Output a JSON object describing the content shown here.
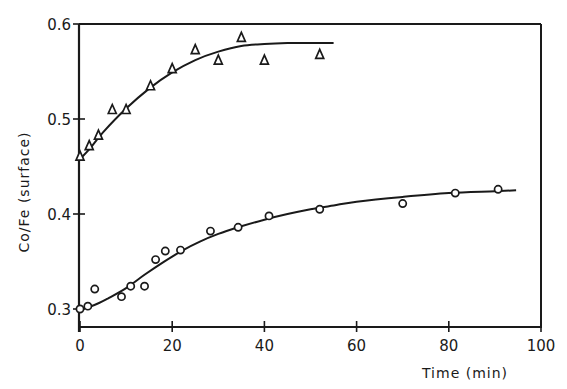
{
  "chart_data": {
    "type": "scatter",
    "title": "",
    "xlabel": "Time (min)",
    "ylabel": "Co/Fe (surface)",
    "xlim": [
      0,
      100
    ],
    "ylim": [
      0.281,
      0.6
    ],
    "x_ticks": [
      0,
      20,
      40,
      60,
      80,
      100
    ],
    "x_tick_labels": [
      "0",
      "20",
      "40",
      "60",
      "80",
      "100"
    ],
    "y_ticks": [
      0.3,
      0.4,
      0.5,
      0.6
    ],
    "y_tick_labels": [
      "0.3",
      "0.4",
      "0.5",
      "0.6"
    ],
    "grid": false,
    "legend": null,
    "series": [
      {
        "name": "triangles",
        "marker": "triangle",
        "x": [
          0,
          2,
          4,
          7,
          10,
          15.3,
          20,
          25,
          30,
          35,
          40,
          52
        ],
        "y": [
          0.461,
          0.472,
          0.483,
          0.51,
          0.51,
          0.535,
          0.553,
          0.573,
          0.562,
          0.586,
          0.562,
          0.568
        ],
        "fit_curve": {
          "x": [
            0,
            2,
            5,
            10,
            15,
            20,
            25,
            30,
            35,
            40,
            45,
            50,
            55
          ],
          "y": [
            0.458,
            0.468,
            0.486,
            0.511,
            0.532,
            0.549,
            0.562,
            0.571,
            0.577,
            0.579,
            0.58,
            0.58,
            0.58
          ],
          "dashed": false
        }
      },
      {
        "name": "circles",
        "marker": "circle",
        "x": [
          0,
          1.7,
          3.2,
          9,
          11,
          14,
          16.4,
          18.5,
          21.8,
          28.3,
          34.3,
          41,
          52,
          70,
          81.4,
          90.7
        ],
        "y": [
          0.3,
          0.303,
          0.321,
          0.313,
          0.324,
          0.324,
          0.352,
          0.361,
          0.362,
          0.382,
          0.386,
          0.398,
          0.405,
          0.411,
          0.422,
          0.426
        ],
        "fit_curve": {
          "x": [
            0,
            3,
            6,
            10,
            14,
            18,
            22,
            26,
            30,
            35,
            40,
            45,
            50,
            55,
            60,
            70,
            80,
            90,
            94.6
          ],
          "y": [
            0.3,
            0.304,
            0.311,
            0.322,
            0.336,
            0.349,
            0.361,
            0.371,
            0.379,
            0.387,
            0.394,
            0.4,
            0.405,
            0.409,
            0.413,
            0.418,
            0.422,
            0.424,
            0.425
          ],
          "dashed": false
        }
      }
    ]
  },
  "labels": {
    "xlabel": "Time (min)",
    "ylabel": "Co/Fe (surface)"
  }
}
